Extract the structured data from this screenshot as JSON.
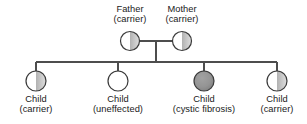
{
  "diagram": {
    "type": "pedigree-chart",
    "title_visible": false,
    "generations": 2,
    "colors": {
      "background": "#ffffff",
      "outline": "#333333",
      "line": "#4d4d4d",
      "unaffected_fill": "#ffffff",
      "carrier_fill": "#a6a6a6",
      "affected_fill": "#909090",
      "text": "#1a1a1a"
    }
  },
  "parents": [
    {
      "id": "father",
      "name": "Father",
      "status": "(carrier)",
      "symbol": "circle-half-shaded",
      "cx": 130,
      "cy": 41,
      "r": 9.5
    },
    {
      "id": "mother",
      "name": "Mother",
      "status": "(carrier)",
      "symbol": "circle-half-shaded",
      "cx": 182,
      "cy": 41,
      "r": 9.5
    }
  ],
  "children": [
    {
      "id": "child-1",
      "name": "Child",
      "status": "(carrier)",
      "symbol": "circle-half-shaded",
      "cx": 36,
      "cy": 81,
      "r": 10
    },
    {
      "id": "child-2",
      "name": "Child",
      "status": "(uneffected)",
      "symbol": "circle-empty",
      "cx": 118,
      "cy": 81,
      "r": 10
    },
    {
      "id": "child-3",
      "name": "Child",
      "status": "(cystic fibrosis)",
      "symbol": "circle-filled",
      "cx": 204,
      "cy": 81,
      "r": 10
    },
    {
      "id": "child-4",
      "name": "Child",
      "status": "(carrier)",
      "symbol": "circle-half-shaded",
      "cx": 277,
      "cy": 81,
      "r": 10
    }
  ],
  "connectors": {
    "marriage_line": {
      "x1": 139.5,
      "y1": 41,
      "x2": 172.5,
      "y2": 41
    },
    "descent_line": {
      "x1": 156,
      "y1": 41,
      "x2": 156,
      "y2": 62
    },
    "sibship_line": {
      "x1": 36,
      "y1": 62,
      "x2": 277,
      "y2": 62
    },
    "child_drops": [
      {
        "x": 36,
        "y1": 62,
        "y2": 71
      },
      {
        "x": 118,
        "y1": 62,
        "y2": 71
      },
      {
        "x": 204,
        "y1": 62,
        "y2": 71
      },
      {
        "x": 277,
        "y1": 62,
        "y2": 71
      }
    ]
  }
}
